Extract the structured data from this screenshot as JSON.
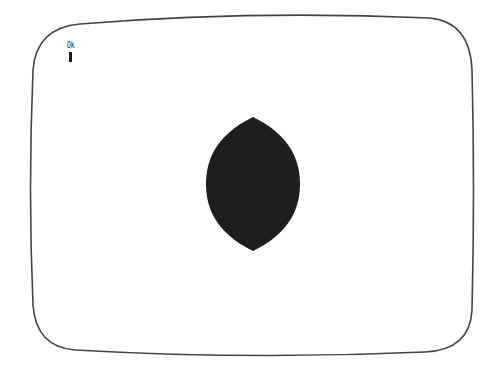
{
  "screen": {
    "prompt": "Ok",
    "cursor": "block-cursor",
    "frame_color": "#444444",
    "background_color": "#ffffff"
  },
  "graphics": {
    "shape": "vesica-lens",
    "fill_color": "#1e1e1e",
    "bounds": {
      "left": 206,
      "top": 117,
      "right": 300,
      "bottom": 251
    }
  }
}
